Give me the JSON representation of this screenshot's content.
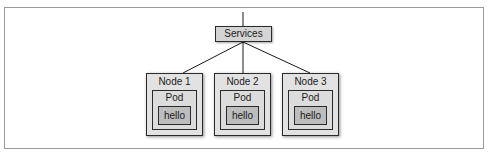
{
  "diagram": {
    "services": {
      "label": "Services"
    },
    "nodes": [
      {
        "label": "Node 1",
        "pod": {
          "label": "Pod",
          "container": {
            "label": "hello"
          }
        }
      },
      {
        "label": "Node 2",
        "pod": {
          "label": "Pod",
          "container": {
            "label": "hello"
          }
        }
      },
      {
        "label": "Node 3",
        "pod": {
          "label": "Pod",
          "container": {
            "label": "hello"
          }
        }
      }
    ],
    "colors": {
      "frame_border": "#9a9a9a",
      "box_border": "#2a2a2a",
      "services_fill": "#d4d4d4",
      "node_fill": "#e2e2e2",
      "pod_fill": "#dcdcdc",
      "container_fill": "#bdbdbd",
      "line": "#1a1a1a"
    }
  }
}
